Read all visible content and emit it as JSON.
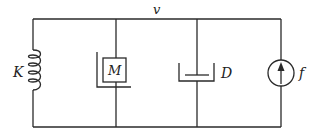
{
  "diagram": {
    "type": "mechanical-analog circuit",
    "node_label": "v",
    "elements": [
      {
        "id": "spring",
        "symbol": "inductor",
        "label": "K"
      },
      {
        "id": "mass",
        "symbol": "mass-box",
        "label": "M"
      },
      {
        "id": "damper",
        "symbol": "dashpot",
        "label": "D"
      },
      {
        "id": "source",
        "symbol": "current-source",
        "label": "f",
        "arrow": "up"
      }
    ],
    "colors": {
      "line": "#2a2a2a",
      "background": "#ffffff"
    }
  }
}
